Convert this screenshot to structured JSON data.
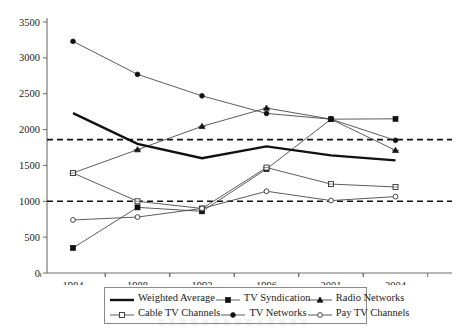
{
  "chart_data": {
    "type": "line",
    "title": "",
    "subtitle": "",
    "xlabel": "",
    "ylabel": "",
    "categories": [
      "1984",
      "1988",
      "1992",
      "1996",
      "2001",
      "2004"
    ],
    "ylim": [
      0,
      3500
    ],
    "yticks": [
      0,
      500,
      1000,
      1500,
      2000,
      2500,
      3000,
      3500
    ],
    "ytick_labels": [
      "0",
      "500",
      "1000",
      "1500",
      "2000",
      "2500",
      "3000",
      "3500"
    ],
    "grid": false,
    "legend_position": "bottom",
    "series": [
      {
        "name": "Weighted Average",
        "marker": "none",
        "style": "thick-solid",
        "values": [
          2230,
          1800,
          1600,
          1765,
          1640,
          1570
        ]
      },
      {
        "name": "TV Syndication",
        "marker": "filled-square",
        "style": "solid",
        "values": [
          350,
          915,
          860,
          1450,
          2145,
          2150
        ]
      },
      {
        "name": "Radio Networks",
        "marker": "triangle",
        "style": "solid",
        "values": [
          1395,
          1720,
          2045,
          2300,
          2145,
          1710
        ]
      },
      {
        "name": "Cable TV Channels",
        "marker": "open-square",
        "style": "solid",
        "values": [
          1395,
          1000,
          900,
          1470,
          1240,
          1200
        ]
      },
      {
        "name": "TV Networks",
        "marker": "filled-circle",
        "style": "solid",
        "values": [
          3230,
          2770,
          2470,
          2225,
          2145,
          1850
        ]
      },
      {
        "name": "Pay TV Channels",
        "marker": "open-circle",
        "style": "solid",
        "values": [
          740,
          780,
          900,
          1140,
          1010,
          1065
        ]
      }
    ],
    "reference_lines": [
      {
        "name": "upper-reference",
        "value": 1860,
        "style": "dashed"
      },
      {
        "name": "lower-reference",
        "value": 1000,
        "style": "dashed"
      }
    ]
  },
  "legend": {
    "rows": [
      [
        {
          "label": "Weighted Average",
          "marker": "none",
          "swatch": "thick-line"
        },
        {
          "label": "TV Syndication",
          "marker": "filled-square",
          "swatch": "line-marker"
        },
        {
          "label": "Radio Networks",
          "marker": "triangle",
          "swatch": "line-marker"
        }
      ],
      [
        {
          "label": "Cable TV Channels",
          "marker": "open-square",
          "swatch": "line-marker"
        },
        {
          "label": "TV Networks",
          "marker": "filled-circle",
          "swatch": "line-marker"
        },
        {
          "label": "Pay TV Channels",
          "marker": "open-circle",
          "swatch": "line-marker"
        }
      ]
    ]
  },
  "colors": {
    "background": "#ffffff",
    "axis": "#6e6e6e",
    "text": "#1a1a1a",
    "series_line": "#4a4a4a",
    "emphasis_line": "#111111",
    "reference_line": "#111111"
  }
}
